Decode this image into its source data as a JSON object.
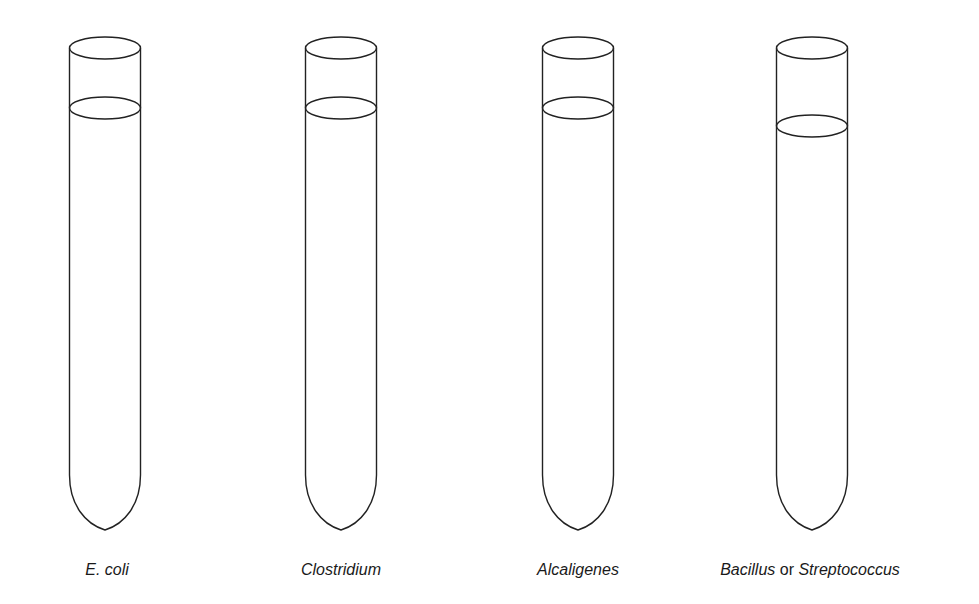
{
  "diagram": {
    "stroke_color": "#222222",
    "background": "#ffffff",
    "tubes": [
      {
        "id": "ecoli",
        "cx": 105,
        "width": 71,
        "top_y": 48,
        "liquid_y": 108,
        "bottom_y": 530
      },
      {
        "id": "clostridium",
        "cx": 341,
        "width": 71,
        "top_y": 48,
        "liquid_y": 108,
        "bottom_y": 530
      },
      {
        "id": "alcaligenes",
        "cx": 578,
        "width": 71,
        "top_y": 48,
        "liquid_y": 108,
        "bottom_y": 530
      },
      {
        "id": "bacillus-streptococcus",
        "cx": 812,
        "width": 71,
        "top_y": 48,
        "liquid_y": 126,
        "bottom_y": 530
      }
    ]
  },
  "labels": [
    {
      "parts": [
        {
          "text": "E. coli",
          "italic": true
        }
      ]
    },
    {
      "parts": [
        {
          "text": "Clostridium",
          "italic": true
        }
      ]
    },
    {
      "parts": [
        {
          "text": "Alcaligenes",
          "italic": true
        }
      ]
    },
    {
      "parts": [
        {
          "text": "Bacillus",
          "italic": true
        },
        {
          "text": " or ",
          "italic": false
        },
        {
          "text": "Streptococcus",
          "italic": true
        }
      ]
    }
  ]
}
